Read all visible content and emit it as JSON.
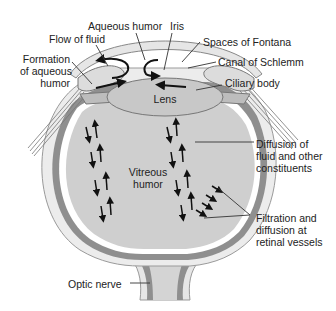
{
  "diagram": {
    "colors": {
      "background": "#ffffff",
      "vitreous": "#cfcfcf",
      "choroid": "#8f8f8f",
      "sclera": "#e6e6e6",
      "outline": "#555555",
      "lens": "#c8c8c8",
      "arrow": "#111111",
      "leader": "#333333"
    },
    "labels": {
      "aqueous_humor": "Aqueous humor",
      "iris": "Iris",
      "flow_of_fluid": "Flow of fluid",
      "spaces_of_fontana": "Spaces of Fontana",
      "formation_of_aqueous_humor": "Formation\nof aqueous\nhumor",
      "canal_of_schlemm": "Canal of Schlemm",
      "ciliary_body": "Ciliary body",
      "lens": "Lens",
      "vitreous_humor": "Vitreous\nhumor",
      "diffusion": "Diffusion of\nfluid and other\nconstituents",
      "filtration": "Filtration and\ndiffusion at\nretinal vessels",
      "optic_nerve": "Optic nerve"
    }
  }
}
